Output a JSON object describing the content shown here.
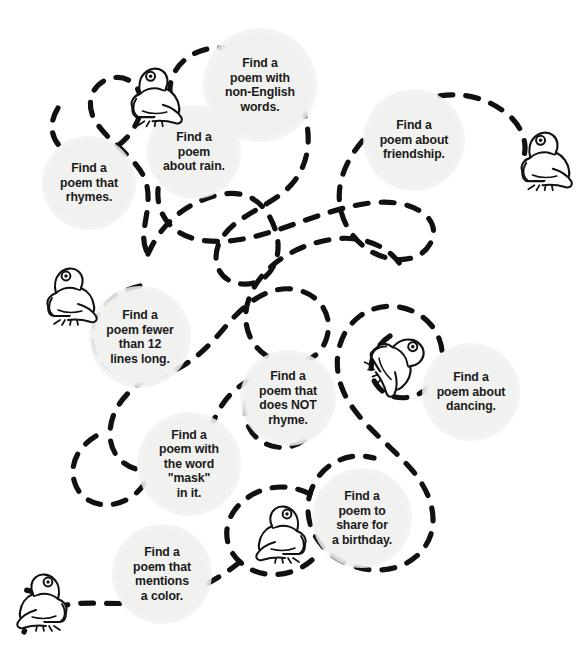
{
  "page": {
    "background_color": "#ffffff",
    "bubble_color": "#f1f1ef",
    "trail_color": "#111111",
    "text_color": "#1a1a1a",
    "width": 584,
    "height": 664
  },
  "bubbles": [
    {
      "id": "non-english-words",
      "text": "Find a\npoem with\nnon-English\nwords.",
      "cx": 260,
      "cy": 85,
      "r": 57
    },
    {
      "id": "friendship",
      "text": "Find a\npoem about\nfriendship.",
      "cx": 414,
      "cy": 140,
      "r": 51
    },
    {
      "id": "about-rain",
      "text": "Find a\npoem\nabout rain.",
      "cx": 194,
      "cy": 152,
      "r": 47
    },
    {
      "id": "rhymes",
      "text": "Find a\npoem that\nrhymes.",
      "cx": 89,
      "cy": 183,
      "r": 47
    },
    {
      "id": "fewer-than-12-lines",
      "text": "Find a\npoem fewer\nthan 12\nlines long.",
      "cx": 140,
      "cy": 337,
      "r": 51
    },
    {
      "id": "does-not-rhyme",
      "text": "Find a\npoem that\ndoes NOT\nrhyme.",
      "cx": 288,
      "cy": 398,
      "r": 48
    },
    {
      "id": "about-dancing",
      "text": "Find a\npoem about\ndancing.",
      "cx": 471,
      "cy": 392,
      "r": 49
    },
    {
      "id": "word-mask",
      "text": "Find a\npoem with\nthe word\n\"mask\"\nin it.",
      "cx": 189,
      "cy": 464,
      "r": 52
    },
    {
      "id": "birthday",
      "text": "Find a\npoem to\nshare for\na birthday.",
      "cx": 362,
      "cy": 518,
      "r": 50
    },
    {
      "id": "mentions-a-color",
      "text": "Find a\npoem that\nmentions\na color.",
      "cx": 162,
      "cy": 574,
      "r": 50
    }
  ],
  "frogs": [
    {
      "id": "frog-top-left",
      "x": 122,
      "y": 62,
      "scale": 1.02,
      "flip": false,
      "rotate": 0
    },
    {
      "id": "frog-top-right",
      "x": 512,
      "y": 126,
      "scale": 1.02,
      "flip": false,
      "rotate": 0
    },
    {
      "id": "frog-mid-left",
      "x": 38,
      "y": 262,
      "scale": 1.0,
      "flip": false,
      "rotate": 0
    },
    {
      "id": "frog-leaping-mid",
      "x": 364,
      "y": 328,
      "scale": 1.02,
      "flip": false,
      "rotate": 58
    },
    {
      "id": "frog-bottom-mid",
      "x": 247,
      "y": 500,
      "scale": 1.0,
      "flip": true,
      "rotate": 0
    },
    {
      "id": "frog-bottom-left",
      "x": 8,
      "y": 568,
      "scale": 1.0,
      "flip": true,
      "rotate": 0
    }
  ],
  "trail": {
    "dash_pattern": "13 13",
    "stroke_width": 5.2,
    "linecap": "round",
    "segments": [
      "M 58 108 C 44 130 56 154 82 156 C 112 158 134 136 140 114 C 146 92 132 74 112 78 C 92 82 84 104 96 122 C 110 144 138 158 146 182 C 154 210 136 234 148 254",
      "M 148 254 C 162 222 186 204 214 196 C 250 186 268 206 276 232 C 284 260 268 286 242 284 C 216 282 210 256 222 238 C 236 216 266 208 286 190 C 306 172 312 146 306 120 C 298 86 270 58 238 50 C 206 42 180 56 172 78 C 164 102 180 124 204 130",
      "M 204 130 C 176 142 160 166 158 190 C 156 216 174 236 200 240 C 236 246 272 232 306 220 C 340 208 374 198 402 204 C 428 210 440 226 430 244 C 420 262 394 264 372 252 C 348 238 336 212 340 186 C 346 150 378 120 412 104 C 444 90 476 92 502 110 C 520 122 528 140 524 156",
      "M 140 286 C 112 292 94 312 94 336 C 94 364 118 382 148 378 C 182 374 206 350 226 326 C 248 300 272 284 298 290 C 322 296 334 318 326 340 C 318 362 292 370 270 358 C 248 346 240 320 250 296 C 262 266 294 246 328 240 C 358 234 386 244 400 264",
      "M 148 378 C 124 392 110 412 110 434 C 110 458 130 474 156 470 C 184 466 204 444 214 420 C 226 392 248 374 276 376 C 300 378 316 394 316 414 C 316 438 294 452 272 446 C 250 440 240 418 248 396",
      "M 96 436 C 76 448 68 468 76 486 C 84 504 106 510 126 500 C 146 490 156 468 150 448",
      "M 390 336 C 372 348 366 368 376 384 C 388 402 414 402 430 386 C 446 370 446 344 432 326 C 414 304 382 300 360 316 C 338 332 332 362 342 388 C 354 420 388 442 412 470 C 434 496 440 526 424 548 C 408 570 376 576 348 564 C 318 552 302 522 310 494 C 318 466 346 450 374 458",
      "M 310 494 C 286 482 260 486 242 502 C 222 520 222 546 240 562 C 260 580 292 578 312 560",
      "M 240 562 C 212 584 182 598 150 602 C 116 606 84 600 62 606 C 44 610 30 620 24 632",
      "M 62 606 C 50 598 38 592 26 590"
    ]
  }
}
